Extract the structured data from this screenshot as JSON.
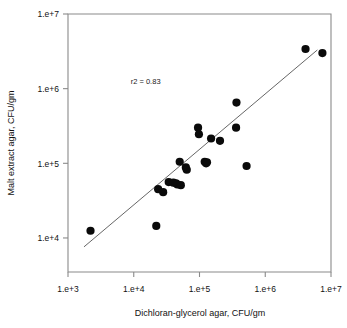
{
  "chart_data": {
    "type": "scatter",
    "title": "",
    "xlabel": "Dichloran-glycerol agar, CFU/gm",
    "ylabel": "Malt extract agar, CFU/gm",
    "xscale": "log",
    "yscale": "log",
    "xlim": [
      1000,
      10000000
    ],
    "ylim": [
      3500,
      10000000
    ],
    "grid": false,
    "legend": null,
    "xticks": [
      {
        "value": 1000,
        "label": "1.e+3"
      },
      {
        "value": 10000,
        "label": "1.e+4"
      },
      {
        "value": 100000,
        "label": "1.e+5"
      },
      {
        "value": 1000000,
        "label": "1.e+6"
      },
      {
        "value": 10000000,
        "label": "1.e+7"
      }
    ],
    "yticks": [
      {
        "value": 10000,
        "label": "1.e+4"
      },
      {
        "value": 100000,
        "label": "1.e+5"
      },
      {
        "value": 1000000,
        "label": "1.e+6"
      },
      {
        "value": 10000000,
        "label": "1.e+7"
      }
    ],
    "annotations": [
      {
        "text": "r2 = 0.83",
        "x": 9000,
        "y": 1150000
      }
    ],
    "series": [
      {
        "name": "samples",
        "marker": "filled-circle",
        "color": "#0a0a0a",
        "points": [
          {
            "x": 2200,
            "y": 12500
          },
          {
            "x": 22000,
            "y": 14500
          },
          {
            "x": 23500,
            "y": 45000
          },
          {
            "x": 28000,
            "y": 41000
          },
          {
            "x": 34000,
            "y": 56000
          },
          {
            "x": 40000,
            "y": 55000
          },
          {
            "x": 44000,
            "y": 54000
          },
          {
            "x": 46000,
            "y": 52000
          },
          {
            "x": 52000,
            "y": 51000
          },
          {
            "x": 50000,
            "y": 105000
          },
          {
            "x": 62000,
            "y": 88000
          },
          {
            "x": 64000,
            "y": 82000
          },
          {
            "x": 95000,
            "y": 300000
          },
          {
            "x": 98000,
            "y": 245000
          },
          {
            "x": 120000,
            "y": 105000
          },
          {
            "x": 126000,
            "y": 100000
          },
          {
            "x": 130000,
            "y": 103000
          },
          {
            "x": 150000,
            "y": 215000
          },
          {
            "x": 205000,
            "y": 200000
          },
          {
            "x": 360000,
            "y": 300000
          },
          {
            "x": 365000,
            "y": 650000
          },
          {
            "x": 520000,
            "y": 92000
          },
          {
            "x": 4100000,
            "y": 3400000
          },
          {
            "x": 7400000,
            "y": 3000000
          }
        ]
      }
    ],
    "fit_line": {
      "name": "regression-line",
      "x_start": 1750,
      "y_start": 7600,
      "x_end": 6200000,
      "y_end": 3300000,
      "r_squared": 0.83
    }
  }
}
